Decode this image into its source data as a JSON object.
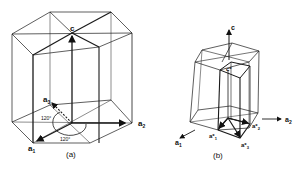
{
  "figure_a": {
    "caption": "(a)",
    "labels": {
      "c": "c",
      "a1": "a",
      "a1_sub": "1",
      "a2": "a",
      "a2_sub": "2",
      "a3": "a",
      "a3_sub": "3",
      "angle_upper": "120°",
      "angle_lower": "120°"
    }
  },
  "figure_b": {
    "caption": "(b)",
    "labels": {
      "c": "c",
      "c_star": "c*",
      "a1": "a",
      "a1_sub": "1",
      "a2": "a",
      "a2_sub": "2",
      "a1_star": "a*",
      "a1_star_sub": "1",
      "a2_star": "a*",
      "a2_star_sub": "2",
      "a3_star": "a*",
      "a3_star_sub": "3"
    }
  },
  "colors": {
    "line": "#1a1a1a",
    "background": "#ffffff"
  }
}
